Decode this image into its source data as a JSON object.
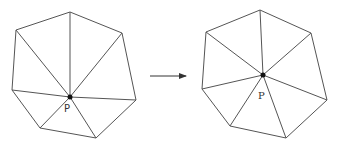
{
  "diagram": {
    "colors": {
      "stroke": "#555555",
      "point": "#111111",
      "label": "#333333",
      "background": "#ffffff"
    },
    "left_figure": {
      "label": "P",
      "point": [
        70,
        97
      ],
      "label_pos": [
        64,
        112
      ],
      "polygon": [
        [
          70,
          12
        ],
        [
          122,
          33
        ],
        [
          136,
          100
        ],
        [
          96,
          138
        ],
        [
          40,
          128
        ],
        [
          12,
          90
        ],
        [
          16,
          30
        ]
      ]
    },
    "arrow": {
      "from": [
        150,
        76
      ],
      "to": [
        186,
        76
      ]
    },
    "right_figure": {
      "label": "P",
      "point": [
        263,
        75
      ],
      "label_pos": [
        258,
        99
      ],
      "polygon": [
        [
          260,
          10
        ],
        [
          311,
          33
        ],
        [
          327,
          100
        ],
        [
          286,
          138
        ],
        [
          230,
          126
        ],
        [
          202,
          89
        ],
        [
          206,
          32
        ]
      ]
    }
  }
}
